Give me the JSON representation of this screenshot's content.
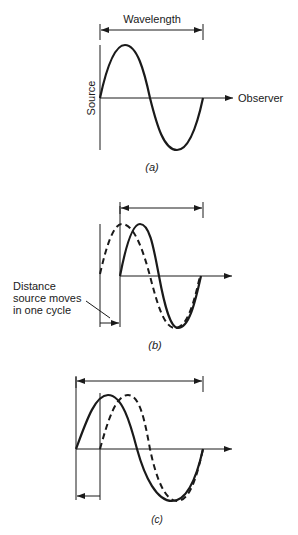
{
  "diagram": {
    "type": "doppler-effect-waves",
    "panels": [
      {
        "id": "a",
        "caption": "(a)",
        "labels": {
          "wavelength": "Wavelength",
          "source": "Source",
          "observer": "Observer"
        }
      },
      {
        "id": "b",
        "caption": "(b)",
        "labels": {
          "distance_line1": "Distance",
          "distance_line2": "source moves",
          "distance_line3": "in one cycle"
        }
      },
      {
        "id": "c",
        "caption": "(c)",
        "labels": {}
      }
    ],
    "colors": {
      "stroke": "#1a1a1a",
      "background": "#ffffff"
    }
  }
}
